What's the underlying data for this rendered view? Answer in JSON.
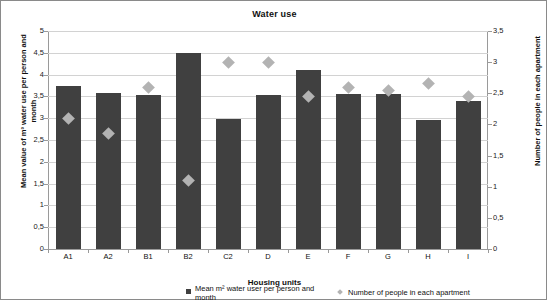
{
  "chart_data": {
    "type": "bar",
    "title": "Water use",
    "xlabel": "Housing units",
    "ylabel": "Mean value of m³ water use per person and month",
    "ylabel_secondary": "Number of people in each apartment",
    "categories": [
      "A1",
      "A2",
      "B1",
      "B2",
      "C2",
      "D",
      "E",
      "F",
      "G",
      "H",
      "I"
    ],
    "ylim": [
      0,
      5
    ],
    "ylim_secondary": [
      0,
      3.5
    ],
    "ytick_labels": [
      "0",
      "0,5",
      "1",
      "1,5",
      "2",
      "2,5",
      "3",
      "3,5",
      "4",
      "4,5",
      "5"
    ],
    "ytick_labels_secondary": [
      "0",
      "0,5",
      "1",
      "1,5",
      "2",
      "2,5",
      "3",
      "3,5"
    ],
    "grid": true,
    "legend_position": "bottom",
    "series": [
      {
        "name": "Mean m² water user per person and month",
        "kind": "bar",
        "axis": "left",
        "color": "#404040",
        "values": [
          3.75,
          3.58,
          3.53,
          4.5,
          2.98,
          3.53,
          4.1,
          3.55,
          3.55,
          2.95,
          3.4
        ]
      },
      {
        "name": "Number of people in each apartment",
        "kind": "scatter",
        "axis": "right",
        "color": "#b3b3b3",
        "marker": "diamond",
        "values": [
          2.1,
          1.85,
          2.6,
          1.1,
          3.0,
          3.0,
          2.45,
          2.6,
          2.55,
          2.65,
          2.45
        ]
      }
    ]
  },
  "legend": {
    "items": [
      {
        "label": "Mean m² water user per person and month",
        "marker": "square",
        "color": "#404040"
      },
      {
        "label": "Number of people in each apartment",
        "marker": "diamond",
        "color": "#b3b3b3"
      }
    ]
  }
}
